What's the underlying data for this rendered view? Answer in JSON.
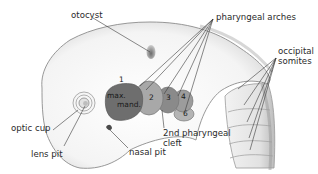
{
  "diagram": {
    "labels": {
      "otocyst": "otocyst",
      "pharyngeal_arches": "pharyngeal arches",
      "occipital_somites_line1": "occipital",
      "occipital_somites_line2": "somites",
      "optic_cup": "optic cup",
      "lens_pit": "lens pit",
      "nasal_pit": "nasal pit",
      "second_cleft_line1": "2nd pharyngeal",
      "second_cleft_line2": "cleft"
    },
    "arch_numbers": {
      "arch1": "1",
      "max": "max.",
      "mand": "mand.",
      "arch2": "2",
      "arch3": "3",
      "arch4": "4",
      "arch6": "6"
    },
    "colors": {
      "arch1": "#6e6e6e",
      "arch2": "#a8a8a8",
      "arch3": "#8a8a8a",
      "arch4": "#9c9c9c",
      "arch6": "#b4b4b4",
      "outline": "#8c8c8c",
      "leader": "#3a3a3a",
      "body_shade": "#e6e6e6"
    }
  }
}
